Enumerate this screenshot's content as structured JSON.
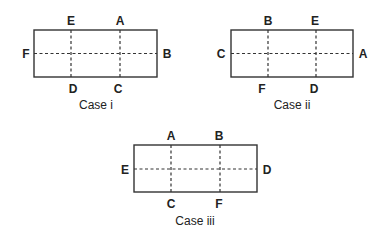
{
  "diagram": {
    "colors": {
      "line": "#333333",
      "text": "#222222",
      "background": "#ffffff"
    },
    "cases": [
      {
        "caption": "Case i",
        "top_labels": [
          "E",
          "A"
        ],
        "bottom_labels": [
          "D",
          "C"
        ],
        "left_label": "F",
        "right_label": "B"
      },
      {
        "caption": "Case ii",
        "top_labels": [
          "B",
          "E"
        ],
        "bottom_labels": [
          "F",
          "D"
        ],
        "left_label": "C",
        "right_label": "A"
      },
      {
        "caption": "Case iii",
        "top_labels": [
          "A",
          "B"
        ],
        "bottom_labels": [
          "C",
          "F"
        ],
        "left_label": "E",
        "right_label": "D"
      }
    ]
  }
}
